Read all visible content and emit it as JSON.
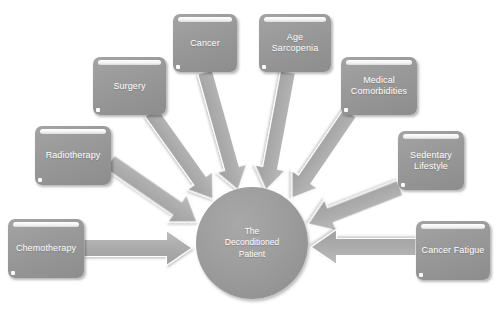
{
  "diagram": {
    "type": "radial-converging-arrows",
    "colors": {
      "background": "#ffffff",
      "box_fill": "#989898",
      "arrow_fill": "#ababab",
      "circle_fill": "#9c9c9c",
      "label_text": "#ffffff",
      "highlight_bar": "#ffffff"
    },
    "center": {
      "label": "The\nDeconditioned\nPatient",
      "shape": "circle",
      "cx": 252,
      "cy": 243,
      "r": 56
    },
    "nodes": [
      {
        "id": "cancer",
        "label": "Cancer",
        "x": 173,
        "y": 14,
        "w": 64,
        "h": 58,
        "arrow": {
          "from_x": 205,
          "from_y": 72,
          "to_x": 238,
          "to_y": 190,
          "width": 15
        }
      },
      {
        "id": "age-sarcopenia",
        "label": "Age\nSarcopenia",
        "x": 259,
        "y": 14,
        "w": 72,
        "h": 58,
        "arrow": {
          "from_x": 288,
          "from_y": 72,
          "to_x": 266,
          "to_y": 190,
          "width": 15
        }
      },
      {
        "id": "surgery",
        "label": "Surgery",
        "x": 93,
        "y": 57,
        "w": 73,
        "h": 58,
        "arrow": {
          "from_x": 151,
          "from_y": 112,
          "to_x": 213,
          "to_y": 199,
          "width": 15
        }
      },
      {
        "id": "medical-comorbidities",
        "label": "Medical\nComorbidities",
        "x": 341,
        "y": 57,
        "w": 76,
        "h": 58,
        "arrow": {
          "from_x": 350,
          "from_y": 113,
          "to_x": 292,
          "to_y": 198,
          "width": 15
        }
      },
      {
        "id": "radiotherapy",
        "label": "Radiotherapy",
        "x": 35,
        "y": 126,
        "w": 76,
        "h": 59,
        "arrow": {
          "from_x": 110,
          "from_y": 162,
          "to_x": 197,
          "to_y": 222,
          "width": 16
        }
      },
      {
        "id": "sedentary-lifestyle",
        "label": "Sedentary\nLifestyle",
        "x": 398,
        "y": 131,
        "w": 66,
        "h": 59,
        "arrow": {
          "from_x": 400,
          "from_y": 188,
          "to_x": 308,
          "to_y": 224,
          "width": 16
        }
      },
      {
        "id": "chemotherapy",
        "label": "Chemotherapy",
        "x": 8,
        "y": 219,
        "w": 76,
        "h": 59,
        "arrow": {
          "from_x": 84,
          "from_y": 248,
          "to_x": 192,
          "to_y": 248,
          "width": 17
        }
      },
      {
        "id": "cancer-fatigue",
        "label": "Cancer Fatigue",
        "x": 416,
        "y": 221,
        "w": 74,
        "h": 59,
        "arrow": {
          "from_x": 416,
          "from_y": 247,
          "to_x": 311,
          "to_y": 247,
          "width": 17
        }
      }
    ]
  }
}
